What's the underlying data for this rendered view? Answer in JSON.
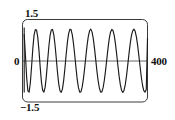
{
  "figure": {
    "name": "waveform-plot",
    "background_color": "#ffffff",
    "frame_color": "#3a3a3a",
    "curve_color": "#1a1a1a",
    "zero_line_color": "#555555"
  },
  "labels": {
    "y_max": "1.5",
    "y_zero": "0",
    "y_min": "−1.5",
    "x_max": "400"
  },
  "chart_data": {
    "type": "line",
    "title": "",
    "xlabel": "",
    "ylabel": "",
    "xlim": [
      0,
      400
    ],
    "ylim": [
      -1.5,
      1.5
    ],
    "grid": false,
    "legend": "none",
    "xticks": [
      400
    ],
    "xticklabels": [
      "400"
    ],
    "yticks": [
      -1.5,
      0,
      1.5
    ],
    "yticklabels": [
      "−1.5",
      "0",
      "1.5"
    ],
    "zero_line": true,
    "annotations": [],
    "series": [
      {
        "name": "signal",
        "color": "#1a1a1a",
        "x": [
          0,
          4,
          8,
          12,
          16,
          20,
          24,
          28,
          32,
          36,
          40,
          44,
          48,
          52,
          56,
          60,
          64,
          68,
          72,
          76,
          80,
          84,
          88,
          92,
          96,
          100,
          104,
          108,
          112,
          116,
          120,
          124,
          128,
          132,
          136,
          140,
          144,
          148,
          152,
          156,
          160,
          164,
          168,
          172,
          176,
          180,
          184,
          188,
          192,
          196,
          200,
          204,
          208,
          212,
          216,
          220,
          224,
          228,
          232,
          236,
          240,
          244,
          248,
          252,
          256,
          260,
          264,
          268,
          272,
          276,
          280,
          284,
          288,
          292,
          296,
          300,
          304,
          308,
          312,
          316,
          320,
          324,
          328,
          332,
          336,
          340,
          344,
          348,
          352,
          356,
          360,
          364,
          368,
          372,
          376,
          380,
          384,
          388,
          392,
          396,
          400
        ],
        "y": [
          0.95,
          0.2,
          -0.62,
          -1.1,
          -1.14,
          -0.8,
          -0.2,
          0.45,
          0.93,
          1.13,
          1.12,
          0.86,
          0.36,
          -0.25,
          -0.78,
          -1.08,
          -1.14,
          -0.96,
          -0.55,
          0.0,
          0.52,
          0.92,
          1.12,
          1.14,
          0.95,
          0.58,
          0.09,
          -0.42,
          -0.84,
          -1.09,
          -1.15,
          -1.03,
          -0.72,
          -0.29,
          0.21,
          0.66,
          0.98,
          1.14,
          1.13,
          0.94,
          0.62,
          0.2,
          -0.26,
          -0.68,
          -0.98,
          -1.14,
          -1.13,
          -0.96,
          -0.67,
          -0.28,
          0.15,
          0.56,
          0.89,
          1.09,
          1.15,
          1.05,
          0.81,
          0.46,
          0.04,
          -0.38,
          -0.74,
          -1.0,
          -1.14,
          -1.13,
          -0.98,
          -0.71,
          -0.35,
          0.06,
          0.46,
          0.81,
          1.04,
          1.14,
          1.1,
          0.92,
          0.62,
          0.24,
          -0.18,
          -0.57,
          -0.88,
          -1.08,
          -1.15,
          -1.07,
          -0.86,
          -0.54,
          -0.15,
          0.26,
          0.63,
          0.92,
          1.09,
          1.15,
          1.07,
          0.87,
          0.56,
          0.18,
          -0.22,
          -0.6,
          -0.9,
          -1.09,
          -1.14,
          -1.05,
          0.82
        ]
      }
    ]
  }
}
